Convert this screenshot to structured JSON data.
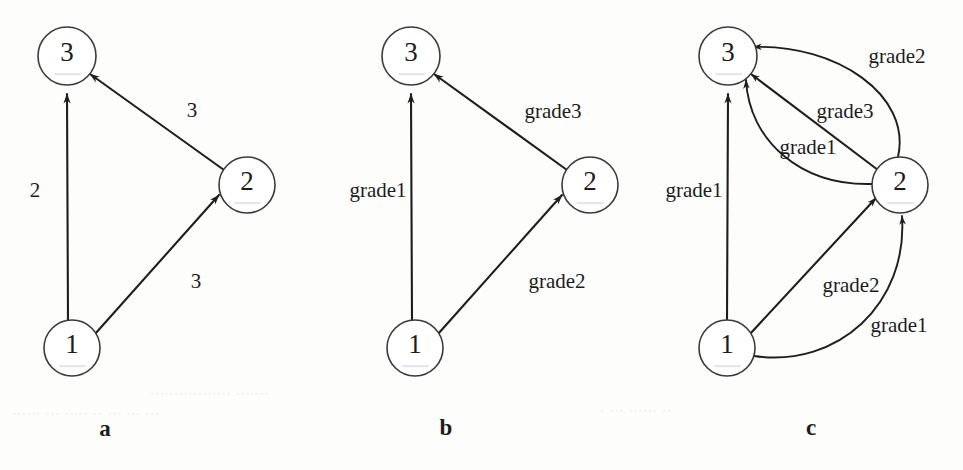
{
  "figure": {
    "background_color": "#fdfdfc",
    "line_color": "#1e1e1e",
    "node_fill": "#ffffff",
    "node_stroke": "#3a3a3a"
  },
  "panels": [
    {
      "id": "a",
      "caption": "a",
      "caption_pos": {
        "x": 105,
        "y": 428
      },
      "nodes": [
        {
          "id": "n3",
          "label": "3",
          "cx": 67,
          "cy": 56,
          "r": 29
        },
        {
          "id": "n2",
          "label": "2",
          "cx": 247,
          "cy": 185,
          "r": 28
        },
        {
          "id": "n1",
          "label": "1",
          "cx": 72,
          "cy": 348,
          "r": 28
        }
      ],
      "edges": [
        {
          "id": "e1-3",
          "from": "n1",
          "to": "n3",
          "label": "2",
          "label_pos": {
            "x": 35,
            "y": 190
          },
          "kind": "straight"
        },
        {
          "id": "e2-3",
          "from": "n2",
          "to": "n3",
          "label": "3",
          "label_pos": {
            "x": 192,
            "y": 110
          },
          "kind": "straight"
        },
        {
          "id": "e1-2",
          "from": "n1",
          "to": "n2",
          "label": "3",
          "label_pos": {
            "x": 196,
            "y": 281
          },
          "kind": "straight"
        }
      ]
    },
    {
      "id": "b",
      "caption": "b",
      "caption_pos": {
        "x": 446,
        "y": 427
      },
      "nodes": [
        {
          "id": "n3",
          "label": "3",
          "cx": 411,
          "cy": 56,
          "r": 29
        },
        {
          "id": "n2",
          "label": "2",
          "cx": 590,
          "cy": 185,
          "r": 28
        },
        {
          "id": "n1",
          "label": "1",
          "cx": 415,
          "cy": 348,
          "r": 28
        }
      ],
      "edges": [
        {
          "id": "e1-3",
          "from": "n1",
          "to": "n3",
          "label": "grade1",
          "label_pos": {
            "x": 378,
            "y": 190
          },
          "kind": "straight"
        },
        {
          "id": "e2-3",
          "from": "n2",
          "to": "n3",
          "label": "grade3",
          "label_pos": {
            "x": 553,
            "y": 111
          },
          "kind": "straight"
        },
        {
          "id": "e1-2",
          "from": "n1",
          "to": "n2",
          "label": "grade2",
          "label_pos": {
            "x": 557,
            "y": 281
          },
          "kind": "straight"
        }
      ]
    },
    {
      "id": "c",
      "caption": "c",
      "caption_pos": {
        "x": 811,
        "y": 427
      },
      "nodes": [
        {
          "id": "n3",
          "label": "3",
          "cx": 728,
          "cy": 56,
          "r": 29
        },
        {
          "id": "n2",
          "label": "2",
          "cx": 900,
          "cy": 185,
          "r": 28
        },
        {
          "id": "n1",
          "label": "1",
          "cx": 727,
          "cy": 348,
          "r": 28
        }
      ],
      "edges": [
        {
          "id": "c1-3",
          "from": "n1",
          "to": "n3",
          "label": "grade1",
          "label_pos": {
            "x": 694,
            "y": 190
          },
          "kind": "straight"
        },
        {
          "id": "c2-3-outer",
          "from": "n2",
          "to": "n3",
          "label": "grade2",
          "label_pos": {
            "x": 897,
            "y": 56
          },
          "kind": "curve-up"
        },
        {
          "id": "c2-3-straight",
          "from": "n2",
          "to": "n3",
          "label": "grade3",
          "label_pos": {
            "x": 845,
            "y": 111
          },
          "kind": "straight"
        },
        {
          "id": "c2-3-inner",
          "from": "n2",
          "to": "n3",
          "label": "grade1",
          "label_pos": {
            "x": 808,
            "y": 147
          },
          "kind": "curve-down"
        },
        {
          "id": "c1-2-straight",
          "from": "n1",
          "to": "n2",
          "label": "grade2",
          "label_pos": {
            "x": 851,
            "y": 285
          },
          "kind": "straight"
        },
        {
          "id": "c1-2-curve",
          "from": "n1",
          "to": "n2",
          "label": "grade1",
          "label_pos": {
            "x": 899,
            "y": 325
          },
          "kind": "curve-down"
        }
      ]
    }
  ]
}
